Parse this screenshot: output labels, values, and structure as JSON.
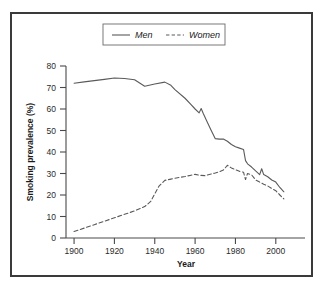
{
  "figure": {
    "frame_color": "#3a3a3a",
    "background": "#ffffff",
    "line_color": "#5a5a5a"
  },
  "chart_data": {
    "type": "line",
    "title": "",
    "xlabel": "Year",
    "ylabel": "Smoking prevalence (%)",
    "xlim": [
      1896,
      2012
    ],
    "ylim": [
      0,
      80
    ],
    "xticks": [
      1900,
      1920,
      1940,
      1960,
      1980,
      2000
    ],
    "xtick_labels": [
      "1900",
      "1920",
      "1940",
      "1960",
      "1980",
      "2000"
    ],
    "yticks": [
      0,
      10,
      20,
      30,
      40,
      50,
      60,
      70,
      80
    ],
    "ytick_labels": [
      "0",
      "10",
      "20",
      "30",
      "40",
      "50",
      "60",
      "70",
      "80"
    ],
    "grid": false,
    "legend_position": "top-center",
    "series": [
      {
        "name": "Men",
        "style": "solid",
        "x": [
          1900,
          1905,
          1910,
          1915,
          1920,
          1925,
          1930,
          1935,
          1940,
          1945,
          1948,
          1950,
          1955,
          1958,
          1960,
          1962,
          1963,
          1964,
          1966,
          1968,
          1970,
          1972,
          1974,
          1976,
          1978,
          1980,
          1982,
          1984,
          1985,
          1986,
          1988,
          1990,
          1992,
          1993,
          1994,
          1996,
          1998,
          2000,
          2002,
          2004
        ],
        "values": [
          72.0,
          72.6,
          73.2,
          73.8,
          74.4,
          74.2,
          73.6,
          70.6,
          71.6,
          72.5,
          71.0,
          69.0,
          65.0,
          62.0,
          60.0,
          58.2,
          60.2,
          58.0,
          54.0,
          50.0,
          46.2,
          46.0,
          46.0,
          45.0,
          43.5,
          42.4,
          41.8,
          41.2,
          36.0,
          34.5,
          33.0,
          31.2,
          29.5,
          32.2,
          29.5,
          28.5,
          27.0,
          26.0,
          23.5,
          21.5
        ]
      },
      {
        "name": "Women",
        "style": "dashed",
        "x": [
          1900,
          1905,
          1910,
          1915,
          1920,
          1925,
          1930,
          1935,
          1938,
          1940,
          1942,
          1945,
          1948,
          1950,
          1955,
          1958,
          1960,
          1962,
          1965,
          1968,
          1970,
          1972,
          1974,
          1976,
          1978,
          1980,
          1982,
          1984,
          1985,
          1986,
          1988,
          1990,
          1992,
          1994,
          1996,
          1998,
          2000,
          2002,
          2004
        ],
        "values": [
          3.0,
          4.6,
          6.2,
          7.8,
          9.4,
          11.0,
          12.6,
          14.6,
          17.0,
          20.5,
          24.0,
          26.8,
          27.4,
          27.8,
          28.6,
          29.2,
          29.6,
          29.2,
          29.0,
          29.8,
          30.2,
          30.8,
          31.6,
          33.8,
          32.6,
          31.8,
          31.0,
          30.6,
          27.2,
          30.0,
          29.4,
          27.0,
          26.0,
          25.0,
          24.2,
          23.0,
          22.0,
          20.0,
          18.2
        ]
      }
    ],
    "legend": [
      {
        "label": "Men",
        "style": "solid"
      },
      {
        "label": "Women",
        "style": "dashed"
      }
    ]
  }
}
